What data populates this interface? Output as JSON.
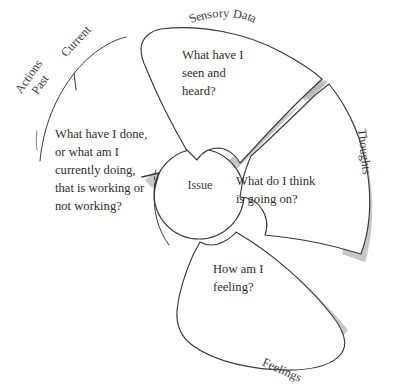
{
  "diagram": {
    "core": {
      "label": "Issue"
    },
    "segments": [
      {
        "id": "sensory",
        "axis_label": "Sensory Data",
        "question": "What have I\nseen and\nheard?",
        "style": "closed-petal"
      },
      {
        "id": "thoughts",
        "axis_label": "Thoughts",
        "question": "What do I think\nis going on?",
        "style": "closed-petal"
      },
      {
        "id": "feelings",
        "axis_label": "Feelings",
        "question": "How am I\nfeeling?",
        "style": "closed-petal"
      },
      {
        "id": "actions",
        "axis_label": "Actions",
        "axis_sublabel_past": "Past",
        "axis_sublabel_current": "Current",
        "question": "What have I done,\nor what am I\ncurrently doing,\nthat is working or\nnot working?",
        "style": "open-sector"
      }
    ],
    "curved_labels": {
      "sensory_data_chars": [
        "S",
        "e",
        "n",
        "s",
        "o",
        "r",
        "y",
        " ",
        "D",
        "a",
        "t",
        "a"
      ]
    },
    "colors": {
      "stroke": "#3a3a3a",
      "fill": "#ffffff",
      "shadow": "#b4b4b4",
      "text": "#2e2e2e",
      "background": "#ffffff"
    }
  }
}
